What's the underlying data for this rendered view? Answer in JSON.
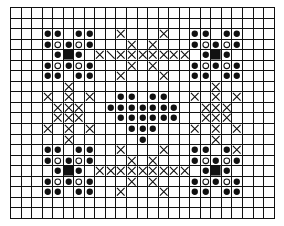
{
  "pattern": {
    "cols": 25,
    "rows": 20,
    "legend": {
      ".": "empty",
      "d": "filled-dot",
      "o": "open-circle",
      "B": "filled-square",
      "X": "cross-stitch",
      "\\": "half-stitch-diagonal"
    },
    "colors": {
      "ink": "#111111",
      "background": "#ffffff"
    },
    "grid": [
      ".........................",
      ".........................",
      "...dd.dd..X...X..dd.dd...",
      "...dodod...X.X...dodod...",
      "....dBd.X\\XXXXXXX.dBd....",
      "...dodod...X.X...dodod...",
      "...dd.dd..X...X..dd.dd...",
      ".....X.............X.....",
      "...X.X.X..dd.dd..X.X.X...",
      "....XXX..ddddddd..XXX....",
      "....XXX...dddddd..XXX....",
      "...X.X.X...ddd...X.X.X...",
      ".....X......d......X.....",
      "...dd.dd..X...X..dd.dX...",
      "...dodod...X.X...dodod...",
      "....dBd.XXXXXXXXX.dBd....",
      "...dodod...X.X...dodod...",
      "...dd.dd..X...X..dd.dd...",
      ".........................",
      "........................."
    ]
  }
}
